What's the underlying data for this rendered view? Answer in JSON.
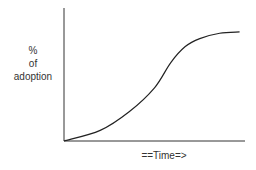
{
  "chart_data": {
    "type": "line",
    "title": "",
    "ylabel_lines": [
      "%",
      "of",
      "adoption"
    ],
    "xlabel": "==Time=>",
    "xlim": [
      0,
      100
    ],
    "ylim": [
      0,
      100
    ],
    "grid": false,
    "legend": "none",
    "series": [
      {
        "name": "adoption",
        "x": [
          0,
          20,
          36,
          50,
          59,
          67,
          75,
          86,
          97
        ],
        "y": [
          0,
          8,
          22,
          40,
          59,
          71,
          77,
          81,
          82
        ]
      }
    ],
    "colors": {
      "axis": "#333333",
      "line": "#222222",
      "text": "#333333"
    }
  }
}
